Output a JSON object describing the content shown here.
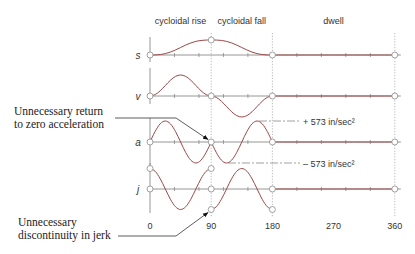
{
  "chart_data": {
    "type": "line",
    "title": "",
    "xlabel": "",
    "x_unit": "degrees of cam rotation",
    "xlim": [
      0,
      360
    ],
    "x_ticks": [
      0,
      90,
      180,
      270,
      360
    ],
    "x_tick_labels": [
      "0",
      "90",
      "180",
      "270",
      "360"
    ],
    "minor_tick_step": 36,
    "boundary_lines_x": [
      90,
      180,
      360
    ],
    "grid": false,
    "colors": {
      "curve": "#9b4848",
      "axis": "#8a8a8a"
    },
    "segments": [
      {
        "label": "cycloidal rise",
        "start": 0,
        "end": 90
      },
      {
        "label": "cycloidal fall",
        "start": 90,
        "end": 180
      },
      {
        "label": "dwell",
        "start": 180,
        "end": 360
      }
    ],
    "series": [
      {
        "name": "s",
        "label": "s",
        "quantity": "displacement (normalized to h)",
        "ylim": [
          0,
          1
        ],
        "pieces": [
          {
            "segment": "cycloidal rise",
            "x": [
              0,
              7.5,
              15,
              22.5,
              30,
              37.5,
              45,
              52.5,
              60,
              67.5,
              75,
              82.5,
              90
            ],
            "y": [
              0,
              0.0037,
              0.0289,
              0.0908,
              0.1955,
              0.3371,
              0.5,
              0.6629,
              0.8045,
              0.9092,
              0.9711,
              0.9963,
              1
            ]
          },
          {
            "segment": "cycloidal fall",
            "x": [
              90,
              97.5,
              105,
              112.5,
              120,
              127.5,
              135,
              142.5,
              150,
              157.5,
              165,
              172.5,
              180
            ],
            "y": [
              1,
              0.9963,
              0.9711,
              0.9092,
              0.8045,
              0.6629,
              0.5,
              0.3371,
              0.1955,
              0.0908,
              0.0289,
              0.0037,
              0
            ]
          },
          {
            "segment": "dwell",
            "x": [
              180,
              360
            ],
            "y": [
              0,
              0
            ]
          }
        ],
        "markers": [
          [
            0,
            0
          ],
          [
            90,
            1
          ],
          [
            180,
            0
          ],
          [
            360,
            0
          ]
        ]
      },
      {
        "name": "v",
        "label": "v",
        "quantity": "velocity (normalized)",
        "ylim": [
          -1,
          1
        ],
        "pieces": [
          {
            "segment": "cycloidal rise",
            "x": [
              0,
              7.5,
              15,
              22.5,
              30,
              37.5,
              45,
              52.5,
              60,
              67.5,
              75,
              82.5,
              90
            ],
            "y": [
              0,
              0.067,
              0.25,
              0.5,
              0.75,
              0.933,
              1,
              0.933,
              0.75,
              0.5,
              0.25,
              0.067,
              0
            ]
          },
          {
            "segment": "cycloidal fall",
            "x": [
              90,
              97.5,
              105,
              112.5,
              120,
              127.5,
              135,
              142.5,
              150,
              157.5,
              165,
              172.5,
              180
            ],
            "y": [
              0,
              -0.067,
              -0.25,
              -0.5,
              -0.75,
              -0.933,
              -1,
              -0.933,
              -0.75,
              -0.5,
              -0.25,
              -0.067,
              0
            ]
          },
          {
            "segment": "dwell",
            "x": [
              180,
              360
            ],
            "y": [
              0,
              0
            ]
          }
        ],
        "markers": [
          [
            0,
            0
          ],
          [
            90,
            0
          ],
          [
            180,
            0
          ],
          [
            360,
            0
          ]
        ]
      },
      {
        "name": "a",
        "label": "a",
        "quantity": "acceleration (in/sec²)",
        "ylim": [
          -573,
          573
        ],
        "pieces": [
          {
            "segment": "cycloidal rise",
            "x": [
              0,
              7.5,
              15,
              22.5,
              30,
              37.5,
              45,
              52.5,
              60,
              67.5,
              75,
              82.5,
              90
            ],
            "y": [
              0,
              286.5,
              496.2,
              573,
              496.2,
              286.5,
              0,
              -286.5,
              -496.2,
              -573,
              -496.2,
              -286.5,
              0
            ]
          },
          {
            "segment": "cycloidal fall",
            "x": [
              90,
              97.5,
              105,
              112.5,
              120,
              127.5,
              135,
              142.5,
              150,
              157.5,
              165,
              172.5,
              180
            ],
            "y": [
              0,
              -286.5,
              -496.2,
              -573,
              -496.2,
              -286.5,
              0,
              286.5,
              496.2,
              573,
              496.2,
              286.5,
              0
            ]
          },
          {
            "segment": "dwell",
            "x": [
              180,
              360
            ],
            "y": [
              0,
              0
            ]
          }
        ],
        "markers": [
          [
            0,
            0
          ],
          [
            90,
            0
          ],
          [
            180,
            0
          ],
          [
            360,
            0
          ]
        ]
      },
      {
        "name": "j",
        "label": "j",
        "quantity": "jerk (normalized)",
        "ylim": [
          -1,
          1
        ],
        "pieces": [
          {
            "segment": "cycloidal rise",
            "x": [
              0,
              7.5,
              15,
              22.5,
              30,
              37.5,
              45,
              52.5,
              60,
              67.5,
              75,
              82.5,
              90
            ],
            "y": [
              1,
              0.866,
              0.5,
              0,
              -0.5,
              -0.866,
              -1,
              -0.866,
              -0.5,
              0,
              0.5,
              0.866,
              1
            ]
          },
          {
            "segment": "cycloidal fall",
            "x": [
              90,
              97.5,
              105,
              112.5,
              120,
              127.5,
              135,
              142.5,
              150,
              157.5,
              165,
              172.5,
              180
            ],
            "y": [
              -1,
              -0.866,
              -0.5,
              0,
              0.5,
              0.866,
              1,
              0.866,
              0.5,
              0,
              -0.5,
              -0.866,
              -1
            ]
          },
          {
            "segment": "dwell",
            "x": [
              180,
              360
            ],
            "y": [
              0,
              0
            ]
          }
        ],
        "markers": [
          [
            0,
            0
          ],
          [
            0,
            1
          ],
          [
            90,
            0
          ],
          [
            90,
            1
          ],
          [
            90,
            -1
          ],
          [
            180,
            0
          ],
          [
            180,
            -1
          ],
          [
            360,
            0
          ]
        ]
      }
    ],
    "annotations": {
      "accel_zero": {
        "line1": "Unnecessary return",
        "line2": "to zero acceleration",
        "target": {
          "series": "a",
          "x": 90,
          "y": 0
        }
      },
      "jerk_discontinuity": {
        "line1": "Unnecessary",
        "line2": "discontinuity in jerk",
        "target": {
          "series": "j",
          "x": 90,
          "y": -1
        }
      },
      "accel_max": {
        "text": "+ 573  in/sec²",
        "value": 573
      },
      "accel_min": {
        "text": "– 573  in/sec²",
        "value": -573
      }
    }
  }
}
